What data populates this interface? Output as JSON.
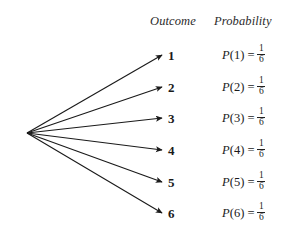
{
  "figure": {
    "type": "probability-tree-diagram",
    "background_color": "#ffffff",
    "ink_color": "#1a1a1a"
  },
  "headers": {
    "outcome": "Outcome",
    "probability": "Probability"
  },
  "rows": [
    {
      "outcome": "1",
      "probability_function": "P",
      "probability_argument": "(1)",
      "equals": "=",
      "numerator": "1",
      "denominator": "6",
      "probability_text": "P(1) = 1/6"
    },
    {
      "outcome": "2",
      "probability_function": "P",
      "probability_argument": "(2)",
      "equals": "=",
      "numerator": "1",
      "denominator": "6",
      "probability_text": "P(2) = 1/6"
    },
    {
      "outcome": "3",
      "probability_function": "P",
      "probability_argument": "(3)",
      "equals": "=",
      "numerator": "1",
      "denominator": "6",
      "probability_text": "P(3) = 1/6"
    },
    {
      "outcome": "4",
      "probability_function": "P",
      "probability_argument": "(4)",
      "equals": "=",
      "numerator": "1",
      "denominator": "6",
      "probability_text": "P(4) = 1/6"
    },
    {
      "outcome": "5",
      "probability_function": "P",
      "probability_argument": "(5)",
      "equals": "=",
      "numerator": "1",
      "denominator": "6",
      "probability_text": "P(5) = 1/6"
    },
    {
      "outcome": "6",
      "probability_function": "P",
      "probability_argument": "(6)",
      "equals": "=",
      "numerator": "1",
      "denominator": "6",
      "probability_text": "P(6) = 1/6"
    }
  ],
  "geometry": {
    "apex_x": 27,
    "apex_y": 133,
    "arrow_tip_x": 162,
    "row_y": [
      55,
      87,
      118,
      150,
      182,
      213
    ]
  }
}
